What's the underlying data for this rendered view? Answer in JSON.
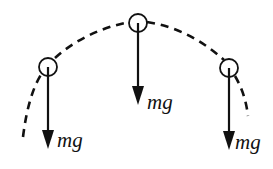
{
  "diagram": {
    "type": "projectile-trajectory-forces",
    "stroke_color": "#111111",
    "background": "#ffffff",
    "trajectory": {
      "style": "dashed",
      "description": "curved dashed path through three ball positions"
    },
    "balls": [
      {
        "id": "left",
        "cx": 48,
        "cy": 67,
        "r": 9
      },
      {
        "id": "top",
        "cx": 138,
        "cy": 23,
        "r": 9
      },
      {
        "id": "right",
        "cx": 229,
        "cy": 68,
        "r": 9
      }
    ],
    "forces": [
      {
        "id": "left",
        "label": "mg",
        "x": 48,
        "y1": 67,
        "y2": 148
      },
      {
        "id": "top",
        "label": "mg",
        "x": 138,
        "y1": 23,
        "y2": 104
      },
      {
        "id": "right",
        "label": "mg",
        "x": 229,
        "y1": 68,
        "y2": 150
      }
    ]
  }
}
